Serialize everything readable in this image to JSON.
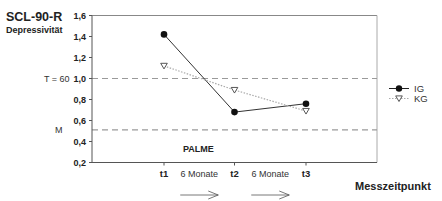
{
  "chart_data": {
    "type": "line",
    "title": "SCL-90-R",
    "subtitle": "Depressivität",
    "xlabel": "Messzeitpunkt",
    "ylabel": "",
    "categories": [
      "t1",
      "t2",
      "t3"
    ],
    "ylim": [
      0.2,
      1.6
    ],
    "yticks": [
      0.2,
      0.4,
      0.6,
      0.8,
      1.0,
      1.2,
      1.4,
      1.6
    ],
    "ytick_labels": [
      "0,2",
      "0,4",
      "0,6",
      "0,8",
      "1,0",
      "1,2",
      "1,4",
      "1,6"
    ],
    "grid": false,
    "series": [
      {
        "name": "IG",
        "values": [
          1.42,
          0.68,
          0.76
        ],
        "marker": "filled-circle",
        "line": "solid",
        "color": "#222222"
      },
      {
        "name": "KG",
        "values": [
          1.12,
          0.89,
          0.69
        ],
        "marker": "open-triangle-down",
        "line": "dotted",
        "color": "#999999"
      }
    ],
    "reference_lines": [
      {
        "label": "T = 60",
        "value": 1.0,
        "style": "dashed",
        "color": "#9a9a9a"
      },
      {
        "label": "M",
        "value": 0.51,
        "style": "dashed",
        "color": "#9a9a9a"
      }
    ],
    "annotations": [
      {
        "text": "PALME",
        "position": "inside-bottom-left"
      },
      {
        "text": "6 Monate",
        "between": [
          "t1",
          "t2"
        ],
        "arrow": "right"
      },
      {
        "text": "6 Monate",
        "between": [
          "t2",
          "t3"
        ],
        "arrow": "right"
      }
    ],
    "legend": {
      "placement": "right",
      "entries": [
        "IG",
        "KG"
      ]
    }
  }
}
